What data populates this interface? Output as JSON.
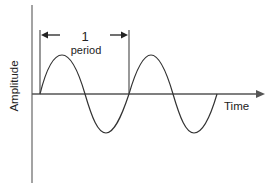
{
  "diagram": {
    "y_axis_label": "Amplitude",
    "x_axis_label": "Time",
    "period_number": "1",
    "period_label": "period",
    "colors": {
      "line": "#333333",
      "axis": "#555555",
      "text": "#222222",
      "background": "#ffffff"
    }
  }
}
